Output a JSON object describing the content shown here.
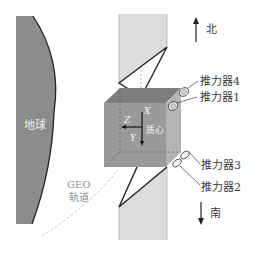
{
  "diagram": {
    "earth_label": "地球",
    "orbit_label_line1": "GEO",
    "orbit_label_line2": "轨道",
    "north_label": "北",
    "south_label": "南",
    "center_of_mass_label": "质心",
    "axes": {
      "x": "X",
      "y": "Y",
      "z": "Z"
    },
    "thrusters": [
      {
        "label": "推力器4"
      },
      {
        "label": "推力器1"
      },
      {
        "label": "推力器3"
      },
      {
        "label": "推力器2"
      }
    ],
    "colors": {
      "earth": "#8c8c8c",
      "earth_edge": "#222222",
      "solar_panel": "#dcdcdc",
      "cube_front": "#9a9a9a",
      "cube_top": "#7e7e7e",
      "cube_side": "#b4b4b4",
      "orbit": "#bdbdbd"
    }
  }
}
